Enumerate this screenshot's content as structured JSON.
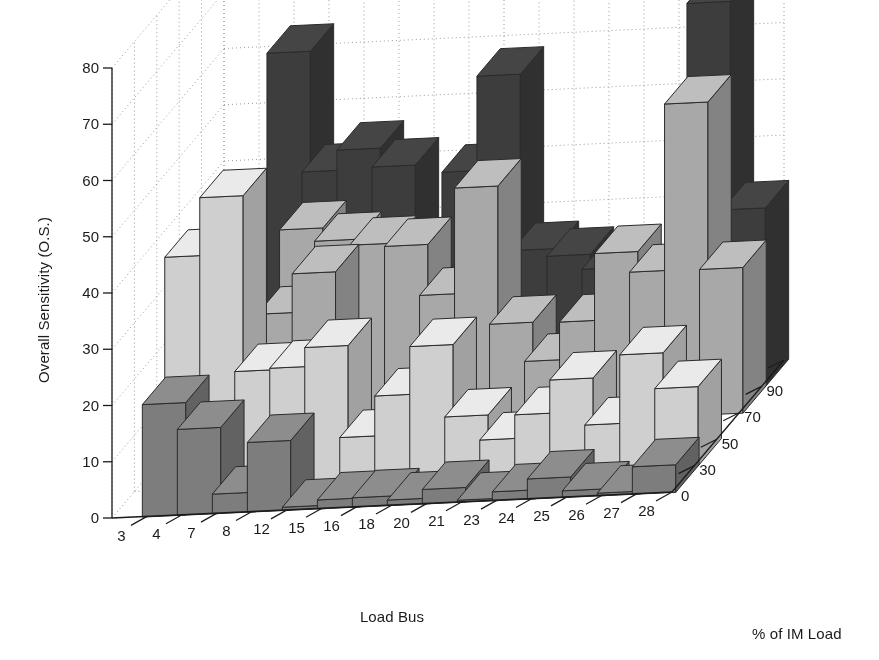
{
  "chart_data": {
    "type": "bar",
    "subtype": "3d-grouped-bar",
    "title": "",
    "xlabel": "Load Bus",
    "ylabel": "Overall Sensitivity (O.S.)",
    "zlabel": "% of IM Load",
    "ylim": [
      0,
      80
    ],
    "yticks": [
      0,
      10,
      20,
      30,
      40,
      50,
      60,
      70,
      80
    ],
    "ytick_labels": [
      "0",
      "10",
      "20",
      "30",
      "40",
      "50",
      "60",
      "70",
      "80"
    ],
    "grid": true,
    "grid_style": "dotted",
    "legend_position": "none",
    "categories": [
      "3",
      "4",
      "7",
      "8",
      "12",
      "15",
      "16",
      "18",
      "20",
      "21",
      "23",
      "24",
      "25",
      "26",
      "27",
      "28"
    ],
    "depth_categories": [
      "0",
      "30",
      "50",
      "70",
      "90"
    ],
    "depth_tick_labels": [
      "0",
      "30",
      "50",
      "70",
      "90"
    ],
    "series": [
      {
        "name": "0",
        "color": "#7d7d7d",
        "values": [
          0,
          20.0,
          15.3,
          3.5,
          12.4,
          0.6,
          1.6,
          1.7,
          1.0,
          2.6,
          0.4,
          1.6,
          3.6,
          1.2,
          0.5,
          4.9
        ]
      },
      {
        "name": "30",
        "color": "#cfcfcf",
        "values": [
          0,
          41.5,
          51.8,
          20.6,
          20.9,
          24.3,
          8.0,
          15.1,
          23.6,
          10.8,
          6.4,
          10.6,
          16.5,
          8.2,
          20.4,
          14.1
        ]
      },
      {
        "name": "50",
        "color": "#a8a8a8",
        "values": [
          0,
          0,
          0,
          26.1,
          33.0,
          0,
          0,
          0,
          0,
          0,
          0,
          0,
          0,
          0,
          0,
          0
        ]
      },
      {
        "name": "70",
        "color": "#a8a8a8",
        "values": [
          0,
          0,
          0,
          36.4,
          34.1,
          33.1,
          32.6,
          23.6,
          42.4,
          17.9,
          11.0,
          17.7,
          29.6,
          26.0,
          55.6,
          25.9
        ]
      },
      {
        "name": "90",
        "color": "#3d3d3d",
        "values": [
          0,
          0,
          63.4,
          42.0,
          45.6,
          42.3,
          19.9,
          40.8,
          57.6,
          26.3,
          25.0,
          22.4,
          0,
          0,
          68.8,
          31.8
        ]
      }
    ]
  },
  "axes": {
    "y_axis_name": "overall-sensitivity-axis",
    "x_axis_name": "load-bus-axis",
    "z_axis_name": "im-load-axis"
  }
}
